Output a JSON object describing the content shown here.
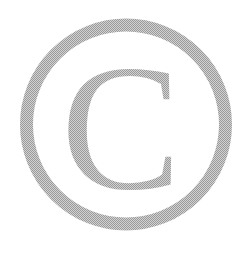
{
  "symbol": {
    "name": "copyright",
    "letter": "C",
    "color_dark": "#9a9a9a",
    "color_light": "#d2d2d2",
    "background": "#ffffff"
  }
}
